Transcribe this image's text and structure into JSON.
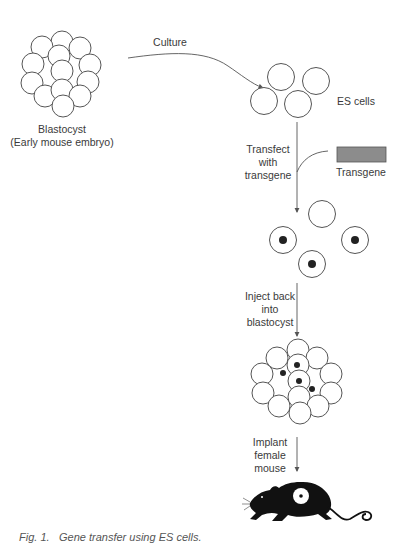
{
  "figure": {
    "caption_number": "Fig. 1.",
    "caption_text": "Gene transfer using ES cells."
  },
  "labels": {
    "blastocyst": "Blastocyst",
    "blastocyst_sub": "(Early mouse embryo)",
    "culture": "Culture",
    "es_cells": "ES cells",
    "transfect_1": "Transfect",
    "transfect_2": "with",
    "transfect_3": "transgene",
    "transgene": "Transgene",
    "inject_1": "Inject back",
    "inject_2": "into",
    "inject_3": "blastocyst",
    "implant_1": "Implant",
    "implant_2": "female",
    "implant_3": "mouse"
  },
  "colors": {
    "stroke": "#555555",
    "transgene_fill": "#8c8c8c",
    "nucleus": "#222222",
    "mouse": "#111111"
  }
}
